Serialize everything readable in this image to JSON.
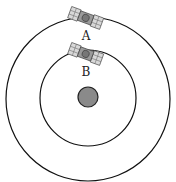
{
  "diagram": {
    "planet": {
      "cx": 88,
      "cy": 97,
      "r": 10,
      "fill": "#8a8a8a"
    },
    "orbits": [
      {
        "name": "outer",
        "cx": 88,
        "cy": 99,
        "r": 82
      },
      {
        "name": "inner",
        "cx": 88,
        "cy": 98,
        "r": 48
      }
    ],
    "satellites": [
      {
        "label": "A",
        "x": 86,
        "y": 17
      },
      {
        "label": "B",
        "x": 86,
        "y": 53
      }
    ]
  }
}
